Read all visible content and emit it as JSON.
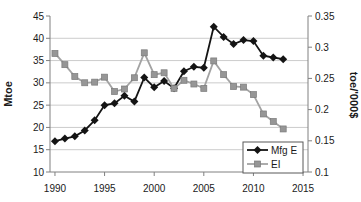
{
  "chart_data": {
    "type": "line",
    "title": "",
    "x": [
      1990,
      1991,
      1992,
      1993,
      1994,
      1995,
      1996,
      1997,
      1998,
      1999,
      2000,
      2001,
      2002,
      2003,
      2004,
      2005,
      2006,
      2007,
      2008,
      2009,
      2010,
      2011,
      2012,
      2013
    ],
    "series": [
      {
        "name": "Mfg E",
        "axis": "left",
        "marker": "diamond",
        "color": "#141414",
        "line_color": "#141414",
        "values": [
          16.9,
          17.5,
          18.0,
          19.3,
          21.6,
          25.0,
          25.4,
          27.1,
          25.8,
          31.2,
          29.0,
          30.4,
          28.8,
          32.6,
          33.6,
          33.4,
          42.6,
          40.3,
          38.7,
          39.6,
          39.4,
          36.1,
          35.7,
          35.3
        ]
      },
      {
        "name": "EI",
        "axis": "right",
        "marker": "square",
        "color": "#969696",
        "line_color": "#a3a3a3",
        "values": [
          0.29,
          0.272,
          0.253,
          0.243,
          0.244,
          0.252,
          0.229,
          0.233,
          0.251,
          0.291,
          0.256,
          0.259,
          0.234,
          0.247,
          0.241,
          0.234,
          0.278,
          0.256,
          0.237,
          0.236,
          0.224,
          0.193,
          0.181,
          0.169
        ]
      }
    ],
    "x_axis": {
      "ticks": [
        1990,
        1995,
        2000,
        2005,
        2010,
        2015
      ],
      "xlim": [
        1989.5,
        2015.5
      ]
    },
    "left_axis": {
      "label": "Mtoe",
      "ticks": [
        10,
        15,
        20,
        25,
        30,
        35,
        40,
        45
      ],
      "ylim": [
        10,
        45
      ]
    },
    "right_axis": {
      "label": "toe/'000$",
      "tick_values": [
        0.1,
        0.15,
        0.2,
        0.25,
        0.3,
        0.35
      ],
      "tick_labels": [
        "0.1",
        "0.15",
        "0.2",
        "0.25",
        "0.3",
        "0.35"
      ],
      "ylim": [
        0.1,
        0.35
      ]
    },
    "grid": "horizontal",
    "legend": {
      "position": "bottom-right",
      "entries": [
        "Mfg E",
        "EI"
      ]
    }
  },
  "colors": {
    "background": "#ffffff",
    "grid": "#cccccc",
    "axis": "#808080",
    "text": "#1a1a1a",
    "legend_border": "#595959"
  }
}
